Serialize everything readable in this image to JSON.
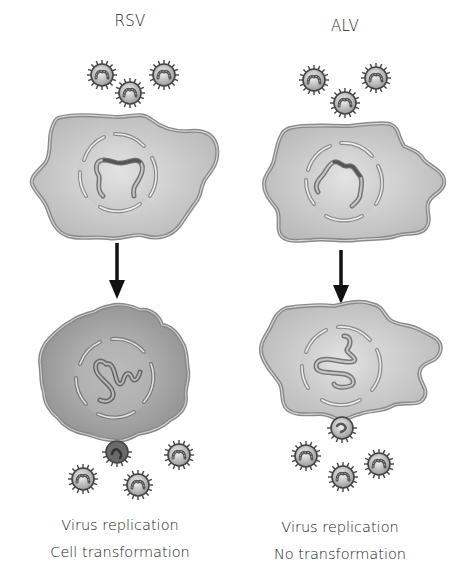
{
  "panels": [
    {
      "id": "rsv",
      "title": "RSV",
      "captions": [
        "Virus replication",
        "Cell transformation"
      ],
      "outcome": {
        "replication": true,
        "transformation": true
      }
    },
    {
      "id": "alv",
      "title": "ALV",
      "captions": [
        "Virus replication",
        "No transformation"
      ],
      "outcome": {
        "replication": true,
        "transformation": false
      }
    }
  ],
  "colors": {
    "cell_fill_normal": "#c8c8c8",
    "cell_fill_transformed": "#a9a9a9",
    "membrane": "#8a8a8a",
    "nucleus_fill": "#d6d6d6",
    "dna": "#7a7a7a",
    "virus_fill": "#d8d8d8",
    "virus_outline": "#444444",
    "arrow": "#111111",
    "text": "#222222"
  },
  "icons": {
    "virus": "virus-particle-icon",
    "arrow": "arrow-down-icon"
  }
}
